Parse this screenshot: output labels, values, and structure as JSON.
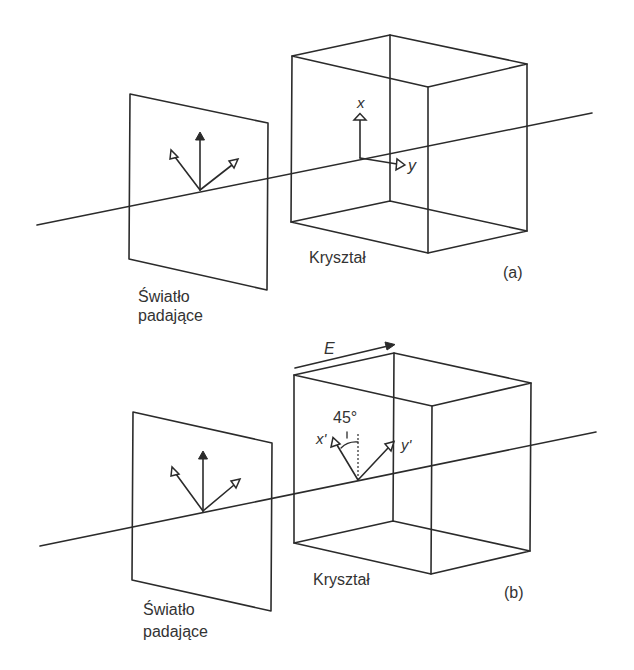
{
  "panels": [
    {
      "id": "a",
      "tag": "(a)",
      "plane_label_line1": "Światło",
      "plane_label_line2": "padające",
      "crystal_label": "Kryształ",
      "axis_x_label": "x",
      "axis_y_label": "y"
    },
    {
      "id": "b",
      "tag": "(b)",
      "plane_label_line1": "Światło",
      "plane_label_line2": "padające",
      "crystal_label": "Kryształ",
      "axis_x_label": "x'",
      "axis_y_label": "y'",
      "field_label": "E",
      "angle_label": "45°"
    }
  ],
  "colors": {
    "stroke": "#2b2b2b",
    "text": "#333333",
    "background": "#ffffff"
  }
}
